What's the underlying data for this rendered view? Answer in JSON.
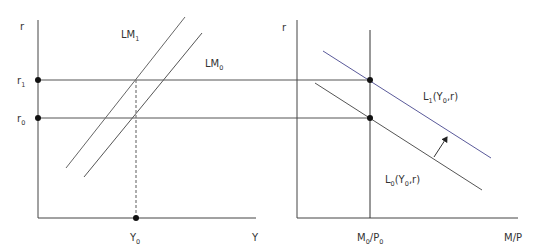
{
  "diagram": {
    "colors": {
      "axis": "#444444",
      "curve": "#555555",
      "shifted_curve": "#5a5a9a",
      "dot": "#111111",
      "text": "#333333"
    },
    "left_panel": {
      "y_axis_label": "r",
      "x_axis_label": "Y",
      "ticks_y": [
        {
          "base": "r",
          "sub": "1"
        },
        {
          "base": "r",
          "sub": "0"
        }
      ],
      "tick_x": {
        "base": "Y",
        "sub": "0"
      },
      "curves": [
        {
          "base": "LM",
          "sub": "1"
        },
        {
          "base": "LM",
          "sub": "0"
        }
      ]
    },
    "right_panel": {
      "y_axis_label": "r",
      "x_axis_label": "M/P",
      "tick_x": {
        "base_a": "M",
        "sub_a": "0",
        "slash": "/P",
        "sub_b": "0"
      },
      "curves": [
        {
          "base": "L",
          "sub": "1",
          "args_pre": "(Y",
          "args_sub": "0",
          "args_post": ",r)"
        },
        {
          "base": "L",
          "sub": "0",
          "args_pre": "(Y",
          "args_sub": "0",
          "args_post": ",r)"
        }
      ],
      "shift_arrow": "arrow-up-right"
    }
  }
}
